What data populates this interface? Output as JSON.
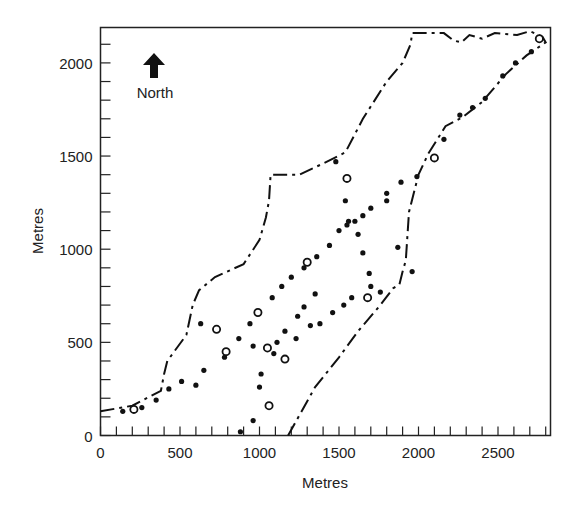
{
  "chart_data": {
    "type": "scatter",
    "title": "",
    "xlabel": "Metres",
    "ylabel": "Metres",
    "xlim": [
      0,
      2830
    ],
    "ylim": [
      0,
      2190
    ],
    "xticks": [
      0,
      500,
      1000,
      1500,
      2000,
      2500
    ],
    "yticks": [
      0,
      500,
      1000,
      1500,
      2000
    ],
    "xtick_labels": [
      "0",
      "500",
      "1000",
      "1500",
      "2000",
      "2500"
    ],
    "ytick_labels": [
      "0",
      "500",
      "1000",
      "1500",
      "2000"
    ],
    "minor_tick_step": 100,
    "grid": false,
    "annotations": [
      {
        "text": "North",
        "type": "north-arrow",
        "x": 350,
        "y": 1950
      }
    ],
    "series": [
      {
        "name": "filled points",
        "marker": "filled-circle",
        "points": [
          [
            140,
            130
          ],
          [
            260,
            150
          ],
          [
            350,
            190
          ],
          [
            430,
            250
          ],
          [
            510,
            290
          ],
          [
            600,
            270
          ],
          [
            650,
            350
          ],
          [
            630,
            600
          ],
          [
            780,
            420
          ],
          [
            870,
            520
          ],
          [
            940,
            600
          ],
          [
            960,
            480
          ],
          [
            1080,
            740
          ],
          [
            1140,
            800
          ],
          [
            1200,
            850
          ],
          [
            1280,
            900
          ],
          [
            1360,
            960
          ],
          [
            1440,
            1020
          ],
          [
            1500,
            1100
          ],
          [
            1550,
            1130
          ],
          [
            1600,
            1150
          ],
          [
            1650,
            1180
          ],
          [
            1700,
            1220
          ],
          [
            1800,
            1260
          ],
          [
            1800,
            1300
          ],
          [
            1890,
            1360
          ],
          [
            1990,
            1390
          ],
          [
            2160,
            1590
          ],
          [
            2260,
            1720
          ],
          [
            2340,
            1760
          ],
          [
            2420,
            1810
          ],
          [
            2530,
            1930
          ],
          [
            2610,
            2000
          ],
          [
            2710,
            2060
          ],
          [
            1480,
            1470
          ],
          [
            1540,
            1260
          ],
          [
            1560,
            1150
          ],
          [
            1620,
            1080
          ],
          [
            1650,
            980
          ],
          [
            1690,
            870
          ],
          [
            1700,
            800
          ],
          [
            1760,
            770
          ],
          [
            1870,
            1010
          ],
          [
            1960,
            880
          ],
          [
            1350,
            760
          ],
          [
            1280,
            690
          ],
          [
            1240,
            640
          ],
          [
            1160,
            560
          ],
          [
            1110,
            500
          ],
          [
            1090,
            440
          ],
          [
            1010,
            330
          ],
          [
            1000,
            260
          ],
          [
            960,
            80
          ],
          [
            880,
            20
          ],
          [
            1230,
            520
          ],
          [
            1320,
            590
          ],
          [
            1380,
            600
          ],
          [
            1460,
            660
          ],
          [
            1530,
            700
          ],
          [
            1580,
            740
          ]
        ]
      },
      {
        "name": "open points",
        "marker": "open-circle",
        "points": [
          [
            210,
            140
          ],
          [
            730,
            570
          ],
          [
            790,
            450
          ],
          [
            990,
            660
          ],
          [
            1050,
            470
          ],
          [
            1060,
            160
          ],
          [
            1160,
            410
          ],
          [
            1300,
            930
          ],
          [
            1550,
            1380
          ],
          [
            1680,
            740
          ],
          [
            2100,
            1490
          ],
          [
            2760,
            2130
          ]
        ]
      },
      {
        "name": "upper boundary",
        "line": "dash-dot",
        "points": [
          [
            0,
            130
          ],
          [
            200,
            160
          ],
          [
            380,
            240
          ],
          [
            400,
            330
          ],
          [
            420,
            400
          ],
          [
            540,
            540
          ],
          [
            580,
            700
          ],
          [
            620,
            780
          ],
          [
            720,
            850
          ],
          [
            900,
            920
          ],
          [
            1000,
            1050
          ],
          [
            1040,
            1170
          ],
          [
            1060,
            1260
          ],
          [
            1070,
            1400
          ],
          [
            1250,
            1400
          ],
          [
            1400,
            1460
          ],
          [
            1540,
            1520
          ],
          [
            1650,
            1700
          ],
          [
            1800,
            1900
          ],
          [
            1900,
            2000
          ],
          [
            1950,
            2100
          ],
          [
            1960,
            2160
          ],
          [
            2160,
            2160
          ],
          [
            2220,
            2120
          ],
          [
            2270,
            2110
          ],
          [
            2320,
            2150
          ],
          [
            2400,
            2130
          ],
          [
            2480,
            2160
          ],
          [
            2620,
            2150
          ],
          [
            2700,
            2170
          ],
          [
            2780,
            2140
          ]
        ]
      },
      {
        "name": "lower boundary",
        "line": "dash-dot",
        "points": [
          [
            1180,
            0
          ],
          [
            1350,
            260
          ],
          [
            1500,
            420
          ],
          [
            1620,
            560
          ],
          [
            1760,
            700
          ],
          [
            1840,
            790
          ],
          [
            1880,
            810
          ],
          [
            1900,
            880
          ],
          [
            1920,
            940
          ],
          [
            1940,
            1200
          ],
          [
            2000,
            1400
          ],
          [
            2060,
            1510
          ],
          [
            2170,
            1660
          ],
          [
            2280,
            1710
          ],
          [
            2400,
            1790
          ],
          [
            2550,
            1940
          ],
          [
            2680,
            2040
          ],
          [
            2800,
            2110
          ],
          [
            2780,
            2140
          ]
        ]
      }
    ]
  }
}
